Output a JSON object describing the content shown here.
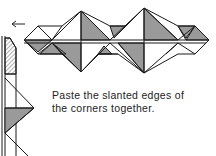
{
  "figure": {
    "caption_lines": [
      "Paste the slanted edges of",
      "the corners together."
    ],
    "arrow": "left-arrow",
    "colors": {
      "line": "#1a1a1a",
      "shade": "#9a9a9a",
      "paper": "#ffffff"
    }
  }
}
